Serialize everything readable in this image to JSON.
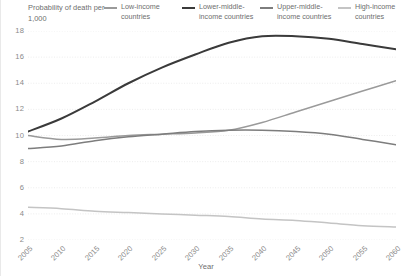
{
  "axis_titles": {
    "y": "Probability of death\nper 1,000",
    "x": "Year"
  },
  "legend": {
    "items": [
      {
        "label": "Low-income\ncountries",
        "color": "#9a9a9a",
        "key": "low_income"
      },
      {
        "label": "Lower-middle-\nincome countries",
        "color": "#3a3a3a",
        "key": "lower_middle_income"
      },
      {
        "label": "Upper-middle-\nincome countries",
        "color": "#7d7d7d",
        "key": "upper_middle_income"
      },
      {
        "label": "High-income\ncountries",
        "color": "#c4c4c4",
        "key": "high_income"
      }
    ]
  },
  "axes": {
    "y_ticks": [
      "18",
      "16",
      "14",
      "12",
      "10",
      "8",
      "6",
      "4",
      "2"
    ],
    "x_ticks": [
      "2005",
      "2010",
      "2015",
      "2020",
      "2025",
      "2030",
      "2035",
      "2040",
      "2045",
      "2050",
      "2055",
      "2060"
    ]
  },
  "chart_data": {
    "type": "line",
    "title": "",
    "subtitle": "",
    "xlabel": "Year",
    "ylabel": "Probability of death per 1,000",
    "xlim": [
      2005,
      2060
    ],
    "ylim": [
      2,
      18
    ],
    "grid": true,
    "grid_axis": "y",
    "legend_position": "top",
    "x": [
      2005,
      2010,
      2015,
      2020,
      2025,
      2030,
      2035,
      2040,
      2045,
      2050,
      2055,
      2060
    ],
    "series": [
      {
        "name": "Low-income countries",
        "color": "#9a9a9a",
        "values": [
          10.0,
          9.7,
          9.8,
          10.0,
          10.1,
          10.2,
          10.4,
          11.0,
          11.8,
          12.6,
          13.4,
          14.2
        ]
      },
      {
        "name": "Lower-middle-income countries",
        "color": "#3a3a3a",
        "values": [
          10.3,
          11.3,
          12.6,
          14.0,
          15.2,
          16.2,
          17.1,
          17.6,
          17.6,
          17.4,
          17.0,
          16.6
        ]
      },
      {
        "name": "Upper-middle-income countries",
        "color": "#7d7d7d",
        "values": [
          9.0,
          9.2,
          9.6,
          9.9,
          10.1,
          10.3,
          10.4,
          10.4,
          10.3,
          10.1,
          9.7,
          9.3
        ]
      },
      {
        "name": "High-income countries",
        "color": "#c4c4c4",
        "values": [
          4.5,
          4.4,
          4.2,
          4.1,
          4.0,
          3.9,
          3.8,
          3.6,
          3.5,
          3.3,
          3.1,
          3.0
        ]
      }
    ]
  }
}
